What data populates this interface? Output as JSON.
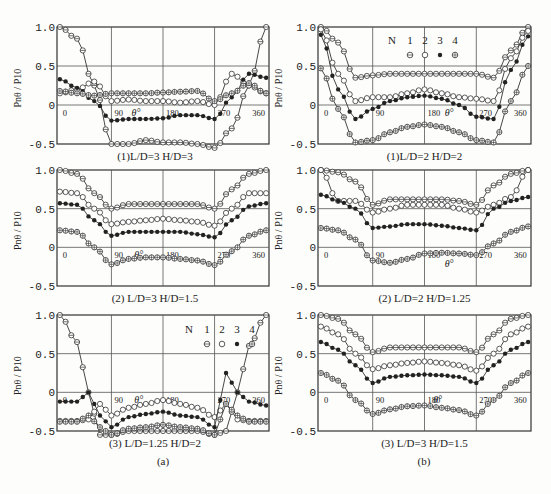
{
  "figure": {
    "group_labels": {
      "a": "(a)",
      "b": "(b)"
    },
    "axis_label_y": "Pnθ / P10",
    "axis_label_x": "θ°",
    "legend": {
      "title": "N",
      "entries": [
        "1",
        "2",
        "3",
        "4"
      ],
      "markers": [
        "circle-bar",
        "open-circle",
        "filled-dot",
        "circle-cross"
      ]
    }
  },
  "chart_data": [
    {
      "id": "a1",
      "type": "line",
      "title": "(1)L/D=3 H/D=3",
      "xlabel": "θ°",
      "ylabel": "Pnθ/P10",
      "xticks": [
        0,
        90,
        180,
        270,
        360
      ],
      "yticks": [
        1.0,
        0.5,
        0,
        -0.5
      ],
      "xlim": [
        -5,
        365
      ],
      "ylim": [
        -0.5,
        1.0
      ],
      "grid": true,
      "x": [
        0,
        30,
        60,
        90,
        120,
        150,
        180,
        210,
        240,
        270,
        300,
        330,
        360
      ],
      "series": [
        {
          "name": "N=1",
          "values": [
            1.0,
            0.85,
            0.25,
            -0.5,
            -0.5,
            -0.45,
            -0.48,
            -0.48,
            -0.5,
            -0.55,
            -0.3,
            0.25,
            1.0
          ]
        },
        {
          "name": "N=2",
          "values": [
            0.15,
            0.2,
            0.3,
            0.05,
            0.07,
            0.05,
            0.05,
            0.03,
            0.05,
            0.0,
            0.4,
            0.25,
            0.15
          ]
        },
        {
          "name": "N=3",
          "values": [
            0.33,
            0.22,
            0.05,
            -0.2,
            -0.18,
            -0.18,
            -0.17,
            -0.13,
            -0.13,
            -0.18,
            0.1,
            0.4,
            0.35
          ]
        },
        {
          "name": "N=4",
          "values": [
            0.18,
            0.15,
            0.12,
            0.15,
            0.15,
            0.15,
            0.16,
            0.17,
            0.18,
            0.05,
            0.15,
            0.28,
            0.15
          ]
        }
      ]
    },
    {
      "id": "b1",
      "type": "line",
      "title": "(1)L/D=2 H/D=2",
      "xlabel": "θ°",
      "ylabel": "Pnθ/P10",
      "xticks": [
        0,
        90,
        180,
        270,
        360
      ],
      "yticks": [
        1.0,
        0.5,
        0,
        -0.5
      ],
      "xlim": [
        -5,
        365
      ],
      "ylim": [
        -0.5,
        1.0
      ],
      "grid": true,
      "legend": {
        "title": "N",
        "entries": [
          "1",
          "2",
          "3",
          "4"
        ]
      },
      "x": [
        0,
        30,
        60,
        90,
        120,
        150,
        180,
        210,
        240,
        270,
        300,
        330,
        360
      ],
      "series": [
        {
          "name": "N=1",
          "values": [
            1.0,
            0.8,
            0.35,
            0.38,
            0.4,
            0.4,
            0.4,
            0.4,
            0.4,
            0.4,
            0.35,
            0.7,
            1.0
          ]
        },
        {
          "name": "N=2",
          "values": [
            0.97,
            0.4,
            0.05,
            0.1,
            0.1,
            0.15,
            0.2,
            0.15,
            0.1,
            0.08,
            0.05,
            0.6,
            0.95
          ]
        },
        {
          "name": "N=3",
          "values": [
            0.9,
            0.2,
            -0.18,
            -0.05,
            0.05,
            0.1,
            0.12,
            0.08,
            0.0,
            -0.15,
            -0.18,
            0.45,
            0.88
          ]
        },
        {
          "name": "N=4",
          "values": [
            0.47,
            -0.05,
            -0.48,
            -0.45,
            -0.35,
            -0.28,
            -0.25,
            -0.28,
            -0.35,
            -0.45,
            -0.48,
            0.05,
            0.5
          ]
        }
      ]
    },
    {
      "id": "a2",
      "type": "line",
      "title": "(2) L/D=3 H/D=1.5",
      "xlabel": "θ°",
      "ylabel": "Pnθ/P10",
      "xticks": [
        0,
        90,
        180,
        270,
        360
      ],
      "yticks": [
        1.0,
        0.5,
        0,
        -0.5
      ],
      "xlim": [
        -5,
        365
      ],
      "ylim": [
        -0.5,
        1.0
      ],
      "grid": true,
      "x": [
        0,
        30,
        60,
        90,
        120,
        150,
        180,
        210,
        240,
        270,
        300,
        330,
        360
      ],
      "series": [
        {
          "name": "N=1",
          "values": [
            1.0,
            0.95,
            0.7,
            0.5,
            0.56,
            0.56,
            0.56,
            0.56,
            0.56,
            0.5,
            0.75,
            0.95,
            1.0
          ]
        },
        {
          "name": "N=2",
          "values": [
            0.72,
            0.7,
            0.5,
            0.3,
            0.33,
            0.35,
            0.37,
            0.35,
            0.33,
            0.28,
            0.5,
            0.7,
            0.7
          ]
        },
        {
          "name": "N=3",
          "values": [
            0.57,
            0.55,
            0.35,
            0.15,
            0.2,
            0.2,
            0.2,
            0.2,
            0.17,
            0.13,
            0.35,
            0.53,
            0.57
          ]
        },
        {
          "name": "N=4",
          "values": [
            0.22,
            0.2,
            0.0,
            -0.22,
            -0.15,
            -0.13,
            -0.13,
            -0.15,
            -0.17,
            -0.23,
            -0.05,
            0.15,
            0.22
          ]
        }
      ]
    },
    {
      "id": "b2",
      "type": "line",
      "title": "(2) L/D=2 H/D=1.25",
      "xlabel": "θ°",
      "ylabel": "Pnθ/P10",
      "xticks": [
        0,
        90,
        180,
        270,
        360
      ],
      "yticks": [
        1.0,
        0.5,
        0,
        -0.5
      ],
      "xlim": [
        -5,
        365
      ],
      "ylim": [
        -0.5,
        1.0
      ],
      "grid": true,
      "x": [
        0,
        30,
        60,
        90,
        120,
        150,
        180,
        210,
        240,
        270,
        300,
        330,
        360
      ],
      "series": [
        {
          "name": "N=1",
          "values": [
            1.0,
            0.97,
            0.85,
            0.55,
            0.62,
            0.62,
            0.62,
            0.62,
            0.6,
            0.55,
            0.8,
            0.95,
            1.0
          ]
        },
        {
          "name": "N=2",
          "values": [
            1.0,
            0.6,
            0.6,
            0.45,
            0.5,
            0.55,
            0.55,
            0.55,
            0.5,
            0.45,
            0.55,
            0.65,
            1.0
          ]
        },
        {
          "name": "N=3",
          "values": [
            0.68,
            0.6,
            0.5,
            0.25,
            0.27,
            0.3,
            0.3,
            0.28,
            0.25,
            0.22,
            0.5,
            0.6,
            0.65
          ]
        },
        {
          "name": "N=4",
          "values": [
            0.25,
            0.22,
            0.1,
            -0.17,
            -0.2,
            -0.15,
            -0.08,
            -0.07,
            -0.08,
            -0.1,
            0.05,
            0.2,
            0.27
          ]
        }
      ]
    },
    {
      "id": "a3",
      "type": "line",
      "title": "(3) L/D=1.25 H/D=2",
      "xlabel": "θ°",
      "ylabel": "Pnθ/P10",
      "xticks": [
        0,
        90,
        180,
        270,
        360
      ],
      "yticks": [
        1.0,
        0.5,
        0,
        -0.5
      ],
      "xlim": [
        -5,
        365
      ],
      "ylim": [
        -0.5,
        1.0
      ],
      "grid": true,
      "legend": {
        "title": "N",
        "entries": [
          "1",
          "2",
          "3",
          "4"
        ]
      },
      "x": [
        0,
        30,
        50,
        70,
        90,
        120,
        150,
        180,
        210,
        240,
        270,
        290,
        310,
        330,
        360
      ],
      "series": [
        {
          "name": "N=1",
          "values": [
            1.0,
            0.65,
            0.0,
            -0.55,
            -0.55,
            -0.5,
            -0.5,
            -0.5,
            -0.5,
            -0.5,
            -0.55,
            -0.5,
            0.0,
            0.6,
            1.0
          ]
        },
        {
          "name": "N=2",
          "values": [
            -0.37,
            -0.37,
            -0.35,
            -0.15,
            -0.3,
            -0.2,
            -0.15,
            -0.1,
            -0.15,
            -0.2,
            -0.32,
            -0.15,
            -0.35,
            -0.37,
            -0.37
          ]
        },
        {
          "name": "N=3",
          "values": [
            -0.12,
            -0.12,
            0.0,
            -0.3,
            -0.45,
            -0.32,
            -0.28,
            -0.25,
            -0.3,
            -0.32,
            -0.45,
            0.25,
            0.0,
            -0.12,
            -0.17
          ]
        },
        {
          "name": "N=4",
          "values": [
            -0.38,
            -0.38,
            -0.3,
            -0.45,
            -0.55,
            -0.47,
            -0.45,
            -0.42,
            -0.45,
            -0.47,
            -0.55,
            -0.15,
            -0.3,
            -0.38,
            -0.38
          ]
        }
      ]
    },
    {
      "id": "b3",
      "type": "line",
      "title": "(3) L/D=3 H/D=1.5",
      "xlabel": "θ°",
      "ylabel": "Pnθ/P10",
      "xticks": [
        0,
        90,
        180,
        270,
        360
      ],
      "yticks": [
        1.0,
        0.5,
        0,
        -0.5
      ],
      "xlim": [
        -5,
        365
      ],
      "ylim": [
        -0.5,
        1.0
      ],
      "grid": true,
      "x": [
        0,
        30,
        60,
        90,
        120,
        150,
        180,
        210,
        240,
        270,
        300,
        330,
        360
      ],
      "series": [
        {
          "name": "N=1",
          "values": [
            1.0,
            0.95,
            0.75,
            0.52,
            0.58,
            0.58,
            0.58,
            0.58,
            0.58,
            0.52,
            0.75,
            0.95,
            1.0
          ]
        },
        {
          "name": "N=2",
          "values": [
            0.85,
            0.75,
            0.5,
            0.3,
            0.35,
            0.38,
            0.4,
            0.38,
            0.35,
            0.28,
            0.5,
            0.75,
            0.85
          ]
        },
        {
          "name": "N=3",
          "values": [
            0.65,
            0.55,
            0.35,
            0.12,
            0.2,
            0.22,
            0.23,
            0.22,
            0.2,
            0.12,
            0.35,
            0.55,
            0.65
          ]
        },
        {
          "name": "N=4",
          "values": [
            0.25,
            0.15,
            -0.1,
            -0.28,
            -0.22,
            -0.18,
            -0.17,
            -0.2,
            -0.23,
            -0.3,
            -0.1,
            0.12,
            0.25
          ]
        }
      ]
    }
  ]
}
